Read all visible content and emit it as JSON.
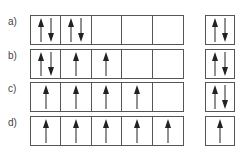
{
  "rows": [
    {
      "label": "a)",
      "cells": [
        [
          "up",
          "down"
        ],
        [
          "up",
          "down"
        ],
        [],
        [],
        []
      ],
      "side": [
        "up",
        "down"
      ]
    },
    {
      "label": "b)",
      "cells": [
        [
          "up",
          "down"
        ],
        [
          "up"
        ],
        [
          "up"
        ],
        [],
        []
      ],
      "side": [
        "up",
        "down"
      ]
    },
    {
      "label": "c)",
      "cells": [
        [
          "up"
        ],
        [
          "up"
        ],
        [
          "up"
        ],
        [
          "up"
        ],
        []
      ],
      "side": [
        "up",
        "down"
      ]
    },
    {
      "label": "d)",
      "cells": [
        [
          "up"
        ],
        [
          "up"
        ],
        [
          "up"
        ],
        [
          "up"
        ],
        [
          "up"
        ]
      ],
      "side": [
        "up"
      ]
    }
  ],
  "colors": {
    "line": "#555555",
    "arrow": "#222222"
  }
}
